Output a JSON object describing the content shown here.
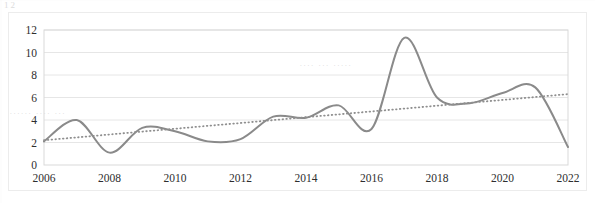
{
  "figure": {
    "background_color": "#ffffff",
    "plot_border_color": "#d9d9d9",
    "gridline_color": "#e6e6e6"
  },
  "artifacts": {
    "top_left_smudge": "12",
    "bleed_text_1": "......  ....   ...",
    "bleed_text_2": ".... ... ....."
  },
  "chart_data": {
    "type": "line",
    "title": "",
    "subtitle": "",
    "xlabel": "",
    "ylabel": "",
    "xlim": [
      2006,
      2022
    ],
    "ylim": [
      0,
      12
    ],
    "grid": true,
    "grid_axis": "y",
    "legend": false,
    "legend_position": "none",
    "x": [
      2006,
      2007,
      2008,
      2009,
      2010,
      2011,
      2012,
      2013,
      2014,
      2015,
      2016,
      2017,
      2018,
      2019,
      2020,
      2021,
      2022
    ],
    "xticks": [
      2006,
      2008,
      2010,
      2012,
      2014,
      2016,
      2018,
      2020,
      2022
    ],
    "xtick_labels": [
      "2006",
      "2008",
      "2010",
      "2012",
      "2014",
      "2016",
      "2018",
      "2020",
      "2022"
    ],
    "yticks": [
      0,
      2,
      4,
      6,
      8,
      10,
      12
    ],
    "ytick_labels": [
      "0",
      "2",
      "4",
      "6",
      "8",
      "10",
      "12"
    ],
    "series": [
      {
        "name": "data-series",
        "style": "solid",
        "color": "#8a8a8a",
        "line_width": 2.0,
        "smoothed": true,
        "values": [
          2.1,
          4.0,
          1.1,
          3.3,
          3.0,
          2.1,
          2.3,
          4.3,
          4.2,
          5.3,
          3.2,
          11.3,
          6.0,
          5.5,
          6.4,
          6.9,
          1.6
        ]
      },
      {
        "name": "trendline",
        "style": "dotted",
        "color": "#8f8f8f",
        "line_width": 1.8,
        "smoothed": false,
        "values": [
          2.2,
          2.45,
          2.71,
          2.97,
          3.22,
          3.48,
          3.73,
          3.99,
          4.25,
          4.5,
          4.76,
          5.01,
          5.27,
          5.53,
          5.78,
          6.04,
          6.3
        ]
      }
    ]
  }
}
